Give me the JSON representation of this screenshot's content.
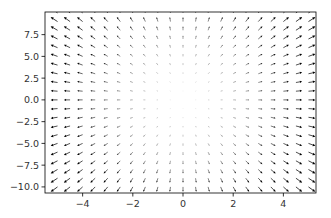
{
  "chart_data": {
    "type": "quiver",
    "title": "",
    "xlabel": "",
    "ylabel": "",
    "xlim": [
      -5.5,
      5.3
    ],
    "ylim": [
      -10.7,
      10.1
    ],
    "grid": false,
    "legend": null,
    "x_ticks": [
      -4,
      -2,
      0,
      2,
      4
    ],
    "x_tick_labels": [
      "−4",
      "−2",
      "0",
      "2",
      "4"
    ],
    "y_ticks": [
      -10.0,
      -7.5,
      -5.0,
      -2.5,
      0.0,
      2.5,
      5.0,
      7.5
    ],
    "y_tick_labels": [
      "−10.0",
      "−7.5",
      "−5.0",
      "−2.5",
      "0.0",
      "2.5",
      "5.0",
      "7.5"
    ],
    "grid_x": {
      "start": -5,
      "stop": 5,
      "count": 21
    },
    "grid_y": {
      "start": -10,
      "stop": 10,
      "count": 21
    },
    "field": {
      "u": "x",
      "v": "y",
      "description": "radial field pointing away from origin, magnitude grows with distance"
    },
    "arrow_color": "#000000"
  }
}
